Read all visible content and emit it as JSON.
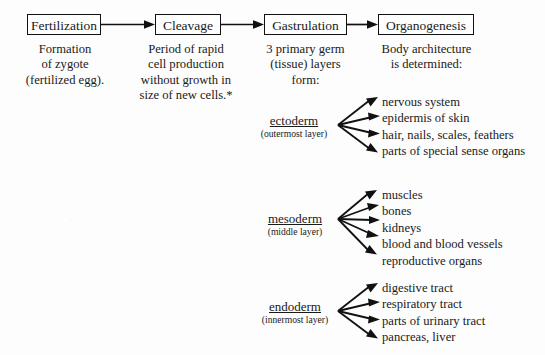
{
  "diagram": {
    "background_color": "#fdfdfd",
    "line_color": "#111111",
    "text_color": "#1a1a1a"
  },
  "stages": [
    {
      "id": "fertilization",
      "label": "Fertilization",
      "caption": [
        "Formation",
        "of zygote",
        "(fertilized egg)."
      ]
    },
    {
      "id": "cleavage",
      "label": "Cleavage",
      "caption": [
        "Period of rapid",
        "cell production",
        "without growth in",
        "size of new cells.*"
      ]
    },
    {
      "id": "gastrulation",
      "label": "Gastrulation",
      "caption": [
        "3 primary germ",
        "(tissue) layers",
        "form:"
      ]
    },
    {
      "id": "organogenesis",
      "label": "Organogenesis",
      "caption": [
        "Body architecture",
        "is determined:"
      ]
    }
  ],
  "germ_layers": [
    {
      "id": "ectoderm",
      "name": "ectoderm",
      "sub": "(outermost layer)",
      "derivatives": [
        "nervous system",
        "epidermis of skin",
        "hair, nails, scales, feathers",
        "parts of special sense organs"
      ]
    },
    {
      "id": "mesoderm",
      "name": "mesoderm",
      "sub": "(middle layer)",
      "derivatives": [
        "muscles",
        "bones",
        "kidneys",
        "blood and blood vessels",
        "reproductive organs"
      ]
    },
    {
      "id": "endoderm",
      "name": "endoderm",
      "sub": "(innermost layer)",
      "derivatives": [
        "digestive tract",
        "respiratory tract",
        "parts of urinary tract",
        "pancreas, liver"
      ]
    }
  ]
}
